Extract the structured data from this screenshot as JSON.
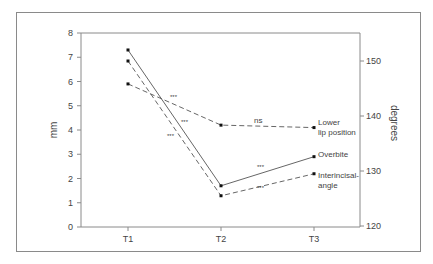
{
  "chart_data": {
    "type": "line",
    "title": "",
    "xlabel": "",
    "ylabel": "mm",
    "ylabel_right": "degrees",
    "categories": [
      "T1",
      "T2",
      "T3"
    ],
    "ylim": [
      0,
      8
    ],
    "ylim_right": [
      120,
      155
    ],
    "yticks": [
      0,
      1,
      2,
      3,
      4,
      5,
      6,
      7,
      8
    ],
    "yticks_right": [
      120,
      130,
      140,
      150
    ],
    "grid": false,
    "legend_position": "inline-right",
    "series": [
      {
        "name": "Lower lip position",
        "axis": "left",
        "unit": "mm",
        "style": "dashed",
        "values": [
          5.9,
          4.2,
          4.1
        ]
      },
      {
        "name": "Overbite",
        "axis": "left",
        "unit": "mm",
        "style": "solid",
        "values": [
          7.3,
          1.7,
          2.9
        ]
      },
      {
        "name": "Interincisal angle",
        "axis": "right",
        "unit": "degrees",
        "style": "dashed",
        "values": [
          150.0,
          125.5,
          129.5
        ]
      }
    ],
    "annotations": [
      {
        "text": "***",
        "between": [
          "T1",
          "T2"
        ],
        "series": "Lower lip position"
      },
      {
        "text": "***",
        "between": [
          "T1",
          "T2"
        ],
        "series": "Overbite"
      },
      {
        "text": "***",
        "between": [
          "T1",
          "T2"
        ],
        "series": "Interincisal angle"
      },
      {
        "text": "ns",
        "between": [
          "T2",
          "T3"
        ],
        "series": "Lower lip position"
      },
      {
        "text": "***",
        "between": [
          "T2",
          "T3"
        ],
        "series": "Overbite"
      },
      {
        "text": "***",
        "between": [
          "T2",
          "T3"
        ],
        "series": "Interincisal angle"
      }
    ]
  },
  "labels": {
    "ylabel": "mm",
    "ylabel_right": "degrees",
    "lower_lip_1": "Lower",
    "lower_lip_2": "lip position",
    "overbite": "Overbite",
    "interincisal_1": "Interincisal-",
    "interincisal_2": "angle",
    "sig": "***",
    "ns": "ns"
  }
}
